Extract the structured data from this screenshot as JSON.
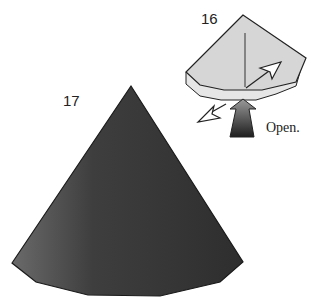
{
  "steps": [
    {
      "number": "16",
      "caption": "Open."
    },
    {
      "number": "17",
      "caption": ""
    }
  ],
  "colors": {
    "paper_light": "#d9d9d9",
    "paper_dark": "#3a3a3a",
    "outline": "#222222",
    "arrow_fill": "#ffffff"
  }
}
